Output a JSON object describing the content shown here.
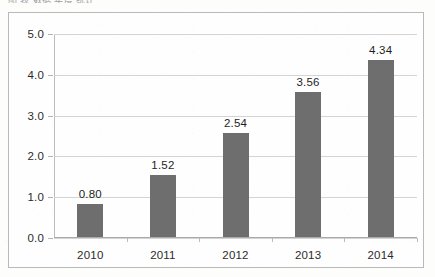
{
  "document": {
    "clipped_caption_fragment": "图   表       数据       年度       统计"
  },
  "chart_data": {
    "type": "bar",
    "title": "",
    "xlabel": "",
    "ylabel": "",
    "categories": [
      "2010",
      "2011",
      "2012",
      "2013",
      "2014"
    ],
    "values": [
      0.8,
      1.52,
      2.54,
      3.56,
      4.34
    ],
    "data_labels": [
      "0.80",
      "1.52",
      "2.54",
      "3.56",
      "4.34"
    ],
    "ylim": [
      0.0,
      5.0
    ],
    "ytick_labels": [
      "0.0",
      "1.0",
      "2.0",
      "3.0",
      "4.0",
      "5.0"
    ],
    "ytick_values": [
      0,
      1,
      2,
      3,
      4,
      5
    ],
    "grid": true,
    "legend": false,
    "legend_position": "none",
    "series": [
      {
        "name": "",
        "values": [
          0.8,
          1.52,
          2.54,
          3.56,
          4.34
        ],
        "color": "#6e6e6e"
      }
    ]
  },
  "style": {
    "bar_color": "#6e6e6e",
    "gridline_color": "#d4d4d4",
    "border_color": "#b9b9b9",
    "text_color": "#2b2b2b",
    "background": "#fdfdfc"
  }
}
